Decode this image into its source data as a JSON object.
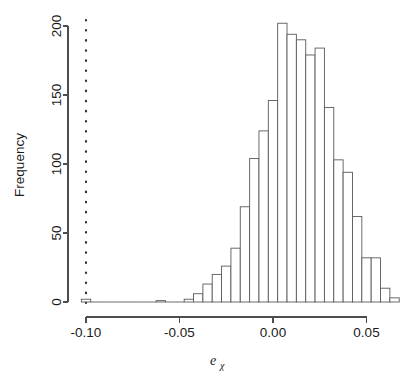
{
  "chart_data": {
    "type": "bar",
    "title": "",
    "subtitle": "",
    "xlabel": "e_chi",
    "xlabel_base": "e",
    "xlabel_subscript": "χ",
    "ylabel": "Frequency",
    "xlim": [
      -0.1025,
      0.0705
    ],
    "ylim": [
      0,
      207
    ],
    "grid": false,
    "legend": null,
    "bin_width": 0.005,
    "x_ticks": [
      -0.1,
      -0.05,
      0,
      0.05
    ],
    "x_tick_labels": [
      "-0.10",
      "-0.05",
      "0.00",
      "0.05"
    ],
    "y_ticks": [
      0,
      50,
      100,
      150,
      200
    ],
    "y_tick_labels": [
      "0",
      "50",
      "100",
      "150",
      "200"
    ],
    "bin_starts": [
      -0.1025,
      -0.0975,
      -0.0925,
      -0.0875,
      -0.0825,
      -0.0775,
      -0.0725,
      -0.0675,
      -0.0625,
      -0.0575,
      -0.0525,
      -0.0475,
      -0.0425,
      -0.0375,
      -0.0325,
      -0.0275,
      -0.0225,
      -0.0175,
      -0.0125,
      -0.0075,
      -0.0025,
      0.0025,
      0.0075,
      0.0125,
      0.0175,
      0.0225,
      0.0275,
      0.0325,
      0.0375,
      0.0425,
      0.0475,
      0.0525,
      0.0575,
      0.0625
    ],
    "values": [
      2,
      0,
      0,
      0,
      0,
      0,
      0,
      0,
      1,
      0,
      0,
      2,
      6,
      13,
      20,
      26,
      39,
      69,
      104,
      124,
      146,
      202,
      194,
      190,
      179,
      184,
      141,
      103,
      94,
      62,
      32,
      32,
      10,
      3
    ],
    "annotations": [
      {
        "name": "reference-line",
        "type": "vertical-dotted-line",
        "x": -0.1,
        "style": "dotted"
      }
    ],
    "colors": {
      "bar_fill": "#ffffff",
      "bar_stroke": "#5a5a5a",
      "axis": "#4d4d4d",
      "text": "#1a1a1a",
      "reference_line": "#333333",
      "background": "#ffffff"
    }
  }
}
